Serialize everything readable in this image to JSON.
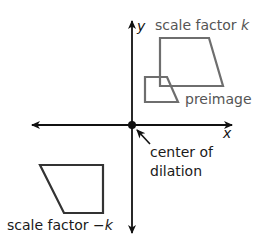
{
  "diagram": {
    "axes": {
      "x_label": "x",
      "y_label": "y",
      "origin": [
        132,
        125
      ]
    },
    "labels": {
      "scale_k_prefix": "scale factor ",
      "scale_k_var": "k",
      "preimage": "preimage",
      "center_line1": "center of",
      "center_line2": "dilation",
      "scale_negk_prefix": "scale factor ",
      "scale_negk_var": "−k"
    },
    "colors": {
      "axis": "#111111",
      "gray_shape": "#6e6e6e",
      "dark_shape": "#333333",
      "gray_text": "#555555",
      "dark_text": "#1a1a1a"
    },
    "shapes": {
      "image_k": [
        [
          160,
          38
        ],
        [
          209,
          38
        ],
        [
          223,
          86
        ],
        [
          160,
          86
        ]
      ],
      "preimage": [
        [
          145,
          77
        ],
        [
          167,
          77
        ],
        [
          178,
          102
        ],
        [
          145,
          102
        ]
      ],
      "image_neg_k": [
        [
          40,
          165
        ],
        [
          103,
          165
        ],
        [
          103,
          213
        ],
        [
          64,
          213
        ]
      ]
    }
  }
}
